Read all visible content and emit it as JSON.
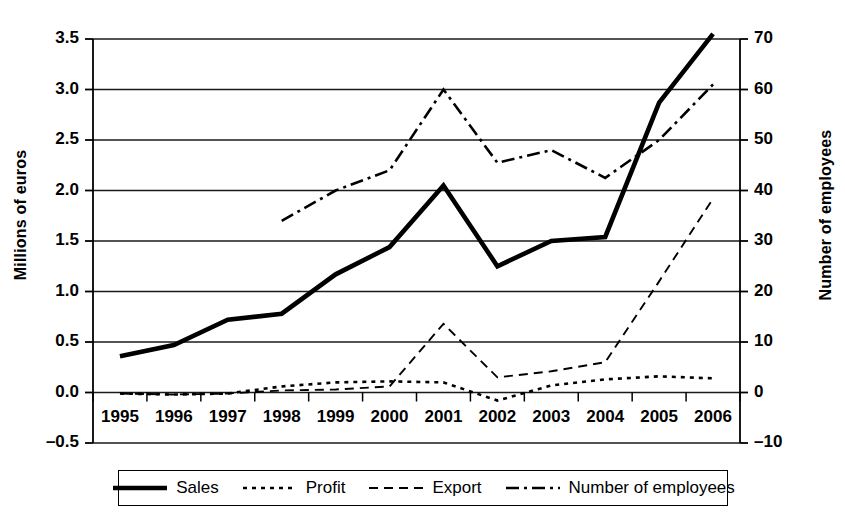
{
  "chart_data": {
    "type": "line",
    "title": "",
    "xlabel": "",
    "ylabel": "Millions of euros",
    "ylabel_secondary": "Number of employees",
    "categories": [
      "1995",
      "1996",
      "1997",
      "1998",
      "1999",
      "2000",
      "2001",
      "2002",
      "2003",
      "2004",
      "2005",
      "2006"
    ],
    "ylim": [
      -0.5,
      3.5
    ],
    "yticks": [
      "-0.5",
      "0.0",
      "0.5",
      "1.0",
      "1.5",
      "2.0",
      "2.5",
      "3.0",
      "3.5"
    ],
    "ylim_secondary": [
      -10,
      70
    ],
    "yticks_secondary": [
      "-10",
      "0",
      "10",
      "20",
      "30",
      "40",
      "50",
      "60",
      "70"
    ],
    "grid": true,
    "legend_position": "bottom",
    "series": [
      {
        "name": "Sales",
        "axis": "left",
        "style": "solid-thick",
        "values": [
          0.36,
          0.47,
          0.72,
          0.78,
          1.17,
          1.44,
          2.05,
          1.25,
          1.5,
          1.54,
          2.87,
          3.55
        ]
      },
      {
        "name": "Profit",
        "axis": "left",
        "style": "dotted",
        "values": [
          -0.01,
          -0.02,
          -0.01,
          0.06,
          0.1,
          0.11,
          0.1,
          -0.08,
          0.07,
          0.13,
          0.16,
          0.14
        ]
      },
      {
        "name": "Export",
        "axis": "left",
        "style": "dashed",
        "values": [
          -0.01,
          -0.02,
          -0.01,
          0.02,
          0.03,
          0.06,
          0.68,
          0.15,
          0.21,
          0.3,
          1.1,
          1.92
        ]
      },
      {
        "name": "Number of employees",
        "axis": "right",
        "style": "dash-dot",
        "values": [
          null,
          null,
          null,
          34,
          40,
          44,
          60,
          45.5,
          48,
          42.5,
          50,
          61
        ]
      }
    ]
  },
  "legend": {
    "items": [
      {
        "label": "Sales",
        "style": "solid-thick"
      },
      {
        "label": "Profit",
        "style": "dotted"
      },
      {
        "label": "Export",
        "style": "dashed"
      },
      {
        "label": "Number of employees",
        "style": "dash-dot"
      }
    ]
  },
  "colors": {
    "ink": "#000000",
    "grid": "#1a1a1a",
    "background": "#ffffff"
  }
}
